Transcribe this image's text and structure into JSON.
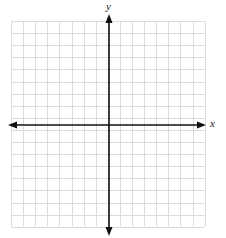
{
  "diagram": {
    "type": "coordinate-plane",
    "x_axis_label": "x",
    "y_axis_label": "y",
    "grid": {
      "left": 11,
      "top": 21,
      "cell": 12.1,
      "cols": 16,
      "rows": 17,
      "line_color": "#dcdcdc"
    },
    "axes": {
      "origin_x": 109,
      "origin_y": 125,
      "x_start": 8,
      "x_end": 206,
      "y_start": 14,
      "y_end": 236,
      "color": "#111111"
    }
  }
}
